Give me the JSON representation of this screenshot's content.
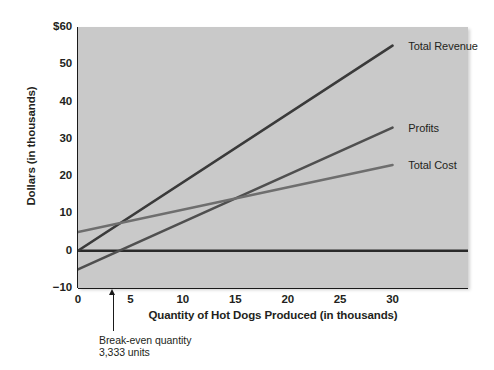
{
  "chart_data": {
    "type": "line",
    "title": "",
    "xlabel": "Quantity of Hot Dogs Produced (in thousands)",
    "ylabel": "Dollars (in thousands)",
    "xlim": [
      0,
      37.2
    ],
    "ylim": [
      -10,
      60
    ],
    "xticks": [
      0,
      5,
      10,
      15,
      20,
      25,
      30
    ],
    "xtick_labels": [
      "0",
      "5",
      "10",
      "15",
      "20",
      "25",
      "30"
    ],
    "yticks": [
      -10,
      0,
      10,
      20,
      30,
      40,
      50,
      60
    ],
    "ytick_labels": [
      "−10",
      "0",
      "10",
      "20",
      "30",
      "40",
      "50",
      "$60"
    ],
    "grid": false,
    "legend_position": "inline-right-of-line-ends",
    "plot_background": "#c9c9c9",
    "series": [
      {
        "name": "Total Revenue",
        "color": "#3a3a3a",
        "x": [
          0,
          30
        ],
        "values": [
          0,
          55
        ],
        "label_x": 31.5,
        "label_y": 55
      },
      {
        "name": "Profits",
        "color": "#4f4f4f",
        "x": [
          0,
          30
        ],
        "values": [
          -5,
          33
        ],
        "label_x": 31.5,
        "label_y": 33
      },
      {
        "name": "Total Cost",
        "color": "#6e6e6e",
        "x": [
          0,
          30
        ],
        "values": [
          5,
          23
        ],
        "label_x": 31.5,
        "label_y": 23
      }
    ],
    "zero_line": {
      "name": "zero-reference-line",
      "y": 0,
      "x_from": 0,
      "x_to": 37.2,
      "color": "#2a2a2a"
    },
    "annotations": [
      {
        "name": "break-even-annotation",
        "x": 3.333,
        "line1": "Break-even quantity",
        "line2": "3,333 units"
      }
    ]
  }
}
